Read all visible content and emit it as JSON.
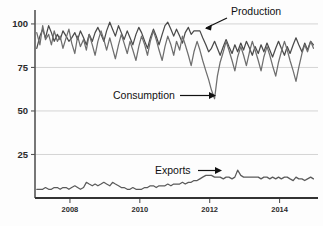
{
  "chart_data": {
    "type": "line",
    "title": "",
    "subtitle": "",
    "xlabel": "",
    "ylabel": "",
    "xlim": [
      2007.0,
      2015.1
    ],
    "ylim": [
      0,
      108
    ],
    "grid": true,
    "grid_axis": "y",
    "legend": "none",
    "annotations": [
      {
        "text": "Production",
        "series": "Production",
        "x": 2011.55,
        "y": 97
      },
      {
        "text": "Consumption",
        "series": "Consumption",
        "x": 2011.95,
        "y": 57
      },
      {
        "text": "Exports",
        "series": "Exports",
        "x": 2011.6,
        "y": 9
      }
    ],
    "yticks": [
      25,
      50,
      75,
      100
    ],
    "ytick_labels": [
      "25",
      "50",
      "75",
      "100"
    ],
    "xticks": [
      2008,
      2010,
      2012,
      2014
    ],
    "xtick_labels": [
      "2008",
      "2010",
      "2012",
      "2014"
    ],
    "series": [
      {
        "name": "Production",
        "color": "#4a4a4a",
        "x": [
          2007.05,
          2007.14,
          2007.22,
          2007.3,
          2007.39,
          2007.47,
          2007.55,
          2007.64,
          2007.72,
          2007.8,
          2007.89,
          2007.97,
          2008.05,
          2008.14,
          2008.22,
          2008.3,
          2008.39,
          2008.47,
          2008.55,
          2008.64,
          2008.72,
          2008.8,
          2008.89,
          2008.97,
          2009.05,
          2009.14,
          2009.22,
          2009.3,
          2009.39,
          2009.47,
          2009.55,
          2009.64,
          2009.72,
          2009.8,
          2009.89,
          2009.97,
          2010.05,
          2010.14,
          2010.22,
          2010.3,
          2010.39,
          2010.47,
          2010.55,
          2010.64,
          2010.72,
          2010.8,
          2010.89,
          2010.97,
          2011.05,
          2011.14,
          2011.22,
          2011.3,
          2011.39,
          2011.47,
          2011.55,
          2011.64,
          2011.72,
          2011.8,
          2011.89,
          2011.97,
          2012.05,
          2012.14,
          2012.22,
          2012.3,
          2012.39,
          2012.47,
          2012.55,
          2012.64,
          2012.72,
          2012.8,
          2012.89,
          2012.97,
          2013.05,
          2013.14,
          2013.22,
          2013.3,
          2013.39,
          2013.47,
          2013.55,
          2013.64,
          2013.72,
          2013.8,
          2013.89,
          2013.97,
          2014.05,
          2014.14,
          2014.22,
          2014.3,
          2014.39,
          2014.47,
          2014.55,
          2014.64,
          2014.72,
          2014.8,
          2014.89,
          2014.97
        ],
        "values": [
          86,
          93,
          97,
          92,
          99,
          95,
          90,
          94,
          91,
          96,
          93,
          90,
          92,
          95,
          91,
          96,
          92,
          88,
          94,
          90,
          95,
          98,
          94,
          90,
          96,
          101,
          97,
          93,
          99,
          95,
          91,
          96,
          92,
          88,
          94,
          98,
          95,
          90,
          86,
          92,
          97,
          93,
          88,
          94,
          99,
          101,
          97,
          93,
          97,
          93,
          89,
          95,
          98,
          94,
          96,
          96,
          96,
          92,
          88,
          84,
          86,
          90,
          86,
          82,
          87,
          91,
          87,
          83,
          88,
          84,
          89,
          85,
          90,
          86,
          82,
          87,
          83,
          88,
          84,
          89,
          85,
          81,
          86,
          90,
          86,
          82,
          87,
          83,
          88,
          92,
          88,
          84,
          89,
          85,
          90,
          88
        ]
      },
      {
        "name": "Consumption",
        "color": "#6e6e6e",
        "x": [
          2007.05,
          2007.14,
          2007.22,
          2007.3,
          2007.39,
          2007.47,
          2007.55,
          2007.64,
          2007.72,
          2007.8,
          2007.89,
          2007.97,
          2008.05,
          2008.14,
          2008.22,
          2008.3,
          2008.39,
          2008.47,
          2008.55,
          2008.64,
          2008.72,
          2008.8,
          2008.89,
          2008.97,
          2009.05,
          2009.14,
          2009.22,
          2009.3,
          2009.39,
          2009.47,
          2009.55,
          2009.64,
          2009.72,
          2009.8,
          2009.89,
          2009.97,
          2010.05,
          2010.14,
          2010.22,
          2010.3,
          2010.39,
          2010.47,
          2010.55,
          2010.64,
          2010.72,
          2010.8,
          2010.89,
          2010.97,
          2011.05,
          2011.14,
          2011.22,
          2011.3,
          2011.39,
          2011.47,
          2011.55,
          2011.64,
          2011.72,
          2011.8,
          2011.89,
          2011.97,
          2012.05,
          2012.14,
          2012.22,
          2012.3,
          2012.39,
          2012.47,
          2012.55,
          2012.64,
          2012.72,
          2012.8,
          2012.89,
          2012.97,
          2013.05,
          2013.14,
          2013.22,
          2013.3,
          2013.39,
          2013.47,
          2013.55,
          2013.64,
          2013.72,
          2013.8,
          2013.89,
          2013.97,
          2014.05,
          2014.14,
          2014.22,
          2014.3,
          2014.39,
          2014.47,
          2014.55,
          2014.64,
          2014.72,
          2014.8,
          2014.89,
          2014.97
        ],
        "values": [
          95,
          88,
          99,
          91,
          94,
          88,
          96,
          90,
          93,
          86,
          92,
          97,
          89,
          83,
          93,
          87,
          91,
          85,
          94,
          88,
          82,
          90,
          96,
          91,
          85,
          92,
          86,
          80,
          88,
          94,
          89,
          83,
          90,
          85,
          79,
          87,
          93,
          88,
          82,
          90,
          96,
          91,
          85,
          79,
          87,
          93,
          88,
          82,
          90,
          85,
          93,
          88,
          82,
          76,
          84,
          90,
          85,
          79,
          73,
          68,
          62,
          57,
          70,
          78,
          84,
          90,
          85,
          79,
          73,
          81,
          87,
          82,
          76,
          84,
          90,
          85,
          79,
          73,
          81,
          87,
          82,
          76,
          70,
          78,
          84,
          90,
          85,
          79,
          73,
          67,
          75,
          83,
          88,
          84,
          90,
          86
        ]
      },
      {
        "name": "Exports",
        "color": "#5a5a5a",
        "x": [
          2007.05,
          2007.14,
          2007.22,
          2007.3,
          2007.39,
          2007.47,
          2007.55,
          2007.64,
          2007.72,
          2007.8,
          2007.89,
          2007.97,
          2008.05,
          2008.14,
          2008.22,
          2008.3,
          2008.39,
          2008.47,
          2008.55,
          2008.64,
          2008.72,
          2008.8,
          2008.89,
          2008.97,
          2009.05,
          2009.14,
          2009.22,
          2009.3,
          2009.39,
          2009.47,
          2009.55,
          2009.64,
          2009.72,
          2009.8,
          2009.89,
          2009.97,
          2010.05,
          2010.14,
          2010.22,
          2010.3,
          2010.39,
          2010.47,
          2010.55,
          2010.64,
          2010.72,
          2010.8,
          2010.89,
          2010.97,
          2011.05,
          2011.14,
          2011.22,
          2011.3,
          2011.39,
          2011.47,
          2011.55,
          2011.64,
          2011.72,
          2011.8,
          2011.89,
          2011.97,
          2012.05,
          2012.14,
          2012.22,
          2012.3,
          2012.39,
          2012.47,
          2012.55,
          2012.64,
          2012.72,
          2012.8,
          2012.89,
          2012.97,
          2013.05,
          2013.14,
          2013.22,
          2013.3,
          2013.39,
          2013.47,
          2013.55,
          2013.64,
          2013.72,
          2013.8,
          2013.89,
          2013.97,
          2014.05,
          2014.14,
          2014.22,
          2014.3,
          2014.39,
          2014.47,
          2014.55,
          2014.64,
          2014.72,
          2014.8,
          2014.89,
          2014.97
        ],
        "values": [
          5,
          5,
          5,
          6,
          5,
          5,
          6,
          6,
          5,
          6,
          6,
          5,
          6,
          7,
          6,
          5,
          6,
          9,
          8,
          7,
          8,
          7,
          8,
          9,
          8,
          7,
          9,
          8,
          7,
          6,
          6,
          5,
          5,
          6,
          5,
          5,
          5,
          6,
          6,
          7,
          7,
          6,
          7,
          7,
          7,
          8,
          7,
          8,
          8,
          8,
          9,
          8,
          9,
          9,
          10,
          10,
          11,
          12,
          13,
          13,
          13,
          12,
          12,
          12,
          11,
          12,
          12,
          11,
          12,
          16,
          13,
          12,
          12,
          12,
          12,
          12,
          12,
          11,
          12,
          12,
          11,
          12,
          11,
          12,
          11,
          12,
          12,
          11,
          10,
          12,
          11,
          11,
          10,
          11,
          12,
          11
        ]
      }
    ]
  }
}
